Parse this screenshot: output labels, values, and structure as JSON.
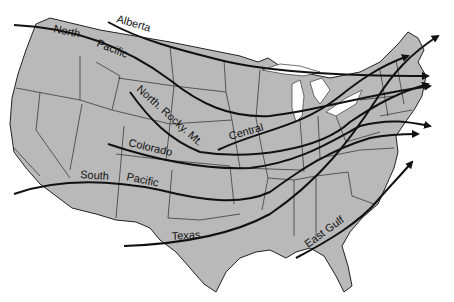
{
  "map": {
    "title": "Storm tracks across the United States",
    "land_color": "#b9b9b9",
    "track_color": "#111111",
    "tracks": [
      {
        "name": "north-pacific",
        "label_parts": [
          "North",
          "Pacific"
        ]
      },
      {
        "name": "alberta",
        "label": "Alberta"
      },
      {
        "name": "north-rocky-mt",
        "label": "North. Rocky. Mt."
      },
      {
        "name": "central",
        "label": "Central"
      },
      {
        "name": "colorado",
        "label": "Colorado"
      },
      {
        "name": "south-pacific",
        "label_parts": [
          "South",
          "Pacific"
        ]
      },
      {
        "name": "texas",
        "label": "Texas"
      },
      {
        "name": "east-gulf",
        "label": "East Gulf"
      }
    ]
  }
}
